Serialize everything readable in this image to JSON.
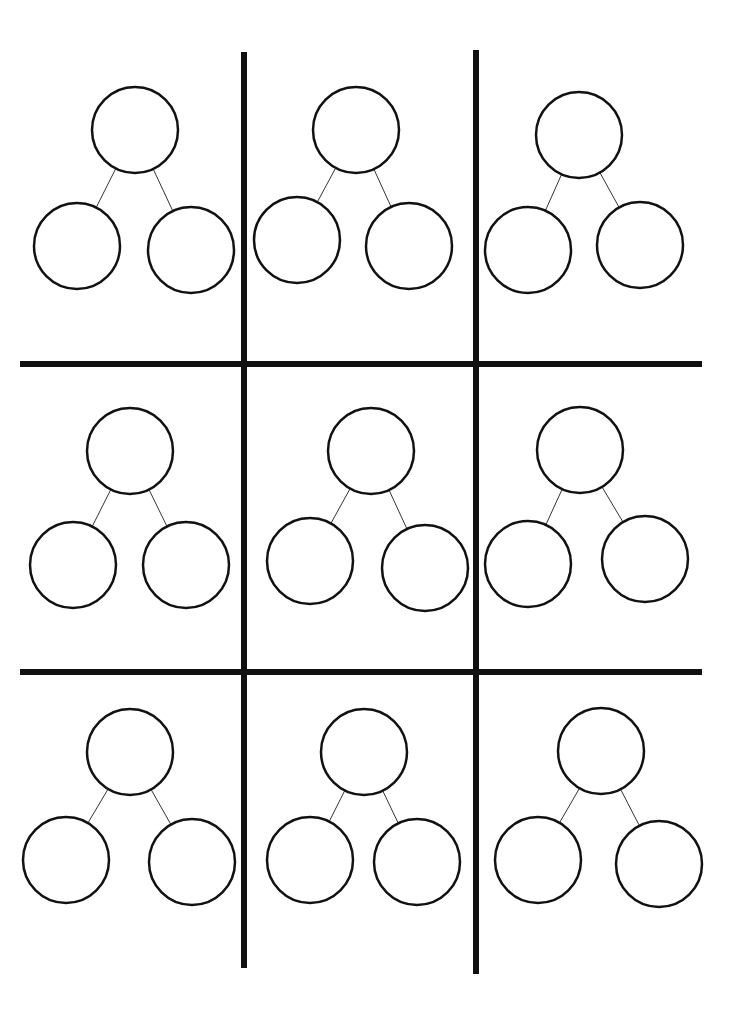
{
  "worksheet": {
    "type": "number-bond-worksheet",
    "rows": 3,
    "cols": 3,
    "ink_color": "#111111",
    "background": "#ffffff",
    "grid_lines": {
      "stroke_width": 6,
      "vertical": [
        {
          "x": 244,
          "y1": 52,
          "y2": 968
        },
        {
          "x": 476,
          "y1": 50,
          "y2": 974
        }
      ],
      "horizontal": [
        {
          "y": 364,
          "x1": 20,
          "x2": 702
        },
        {
          "y": 672,
          "x1": 20,
          "x2": 702
        }
      ]
    },
    "circle_radius": 43,
    "bonds": [
      {
        "top": [
          135,
          130
        ],
        "left": [
          77,
          246
        ],
        "right": [
          191,
          250
        ]
      },
      {
        "top": [
          356,
          130
        ],
        "left": [
          297,
          240
        ],
        "right": [
          409,
          246
        ]
      },
      {
        "top": [
          579,
          135
        ],
        "left": [
          528,
          250
        ],
        "right": [
          640,
          245
        ]
      },
      {
        "top": [
          130,
          451
        ],
        "left": [
          73,
          565
        ],
        "right": [
          186,
          565
        ]
      },
      {
        "top": [
          371,
          451
        ],
        "left": [
          310,
          561
        ],
        "right": [
          425,
          568
        ]
      },
      {
        "top": [
          580,
          450
        ],
        "left": [
          528,
          564
        ],
        "right": [
          645,
          559
        ]
      },
      {
        "top": [
          130,
          752
        ],
        "left": [
          66,
          860
        ],
        "right": [
          192,
          862
        ]
      },
      {
        "top": [
          364,
          752
        ],
        "left": [
          310,
          860
        ],
        "right": [
          417,
          862
        ]
      },
      {
        "top": [
          601,
          751
        ],
        "left": [
          538,
          860
        ],
        "right": [
          659,
          864
        ]
      }
    ],
    "values": [
      {
        "whole": "",
        "part1": "",
        "part2": ""
      },
      {
        "whole": "",
        "part1": "",
        "part2": ""
      },
      {
        "whole": "",
        "part1": "",
        "part2": ""
      },
      {
        "whole": "",
        "part1": "",
        "part2": ""
      },
      {
        "whole": "",
        "part1": "",
        "part2": ""
      },
      {
        "whole": "",
        "part1": "",
        "part2": ""
      },
      {
        "whole": "",
        "part1": "",
        "part2": ""
      },
      {
        "whole": "",
        "part1": "",
        "part2": ""
      },
      {
        "whole": "",
        "part1": "",
        "part2": ""
      }
    ]
  }
}
